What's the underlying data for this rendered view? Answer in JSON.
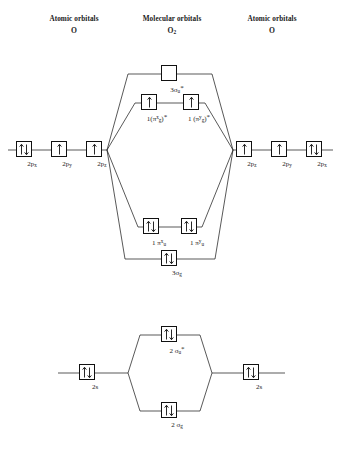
{
  "headers": {
    "left": {
      "title": "Atomic orbitals",
      "species": "O"
    },
    "middle": {
      "title": "Molecular orbitals",
      "species": "O",
      "species_sub": "2"
    },
    "right": {
      "title": "Atomic orbitals",
      "species": "O"
    }
  },
  "colors": {
    "line": "#111111",
    "box_border": "#111111",
    "box_fill": "#ffffff",
    "text": "#1a1a1a",
    "background": "#ffffff"
  },
  "upper_diagram": {
    "caption": "2p atomic orbitals combining into molecular orbitals of O2",
    "left_atomic": [
      {
        "id": "left-2px",
        "label_base": "2p",
        "label_sub": "x",
        "electrons": "up-down"
      },
      {
        "id": "left-2py",
        "label_base": "2p",
        "label_sub": "y",
        "electrons": "up"
      },
      {
        "id": "left-2pz",
        "label_base": "2p",
        "label_sub": "z",
        "electrons": "up"
      }
    ],
    "right_atomic": [
      {
        "id": "right-2pz",
        "label_base": "2p",
        "label_sub": "z",
        "electrons": "up"
      },
      {
        "id": "right-2py",
        "label_base": "2p",
        "label_sub": "y",
        "electrons": "up"
      },
      {
        "id": "right-2px",
        "label_base": "2p",
        "label_sub": "x",
        "electrons": "up-down"
      }
    ],
    "molecular": [
      {
        "id": "mo-3sigma-u-star",
        "label_base": "3σ",
        "label_sub": "u",
        "star": true,
        "electrons": "none"
      },
      {
        "id": "mo-1pi-gx-star",
        "label_base": "1(π",
        "label_sup": "x",
        "label_sub": "g",
        "label_tail": ")",
        "star": true,
        "electrons": "up"
      },
      {
        "id": "mo-1pi-gy-star",
        "label_base": "1 (π",
        "label_sup": "y",
        "label_sub": "g",
        "label_tail": ")",
        "star": true,
        "electrons": "up"
      },
      {
        "id": "mo-1pi-ux",
        "label_base": "1 π",
        "label_sup": "x",
        "label_sub": "u",
        "star": false,
        "electrons": "up-down"
      },
      {
        "id": "mo-1pi-uy",
        "label_base": "1 π",
        "label_sup": "y",
        "label_sub": "u",
        "star": false,
        "electrons": "up-down"
      },
      {
        "id": "mo-3sigma-g",
        "label_base": "3σ",
        "label_sub": "g",
        "star": false,
        "electrons": "up-down"
      }
    ]
  },
  "lower_diagram": {
    "caption": "2s atomic orbitals combining into sigma molecular orbitals",
    "left_atomic": [
      {
        "id": "left-2s",
        "label_base": "2s",
        "electrons": "up-down"
      }
    ],
    "right_atomic": [
      {
        "id": "right-2s",
        "label_base": "2s",
        "electrons": "up-down"
      }
    ],
    "molecular": [
      {
        "id": "mo-2sigma-u-star",
        "label_base": "2 σ",
        "label_sub": "u",
        "star": true,
        "electrons": "up-down"
      },
      {
        "id": "mo-2sigma-g",
        "label_base": "2 σ",
        "label_sub": "g",
        "star": false,
        "electrons": "up-down"
      }
    ]
  }
}
